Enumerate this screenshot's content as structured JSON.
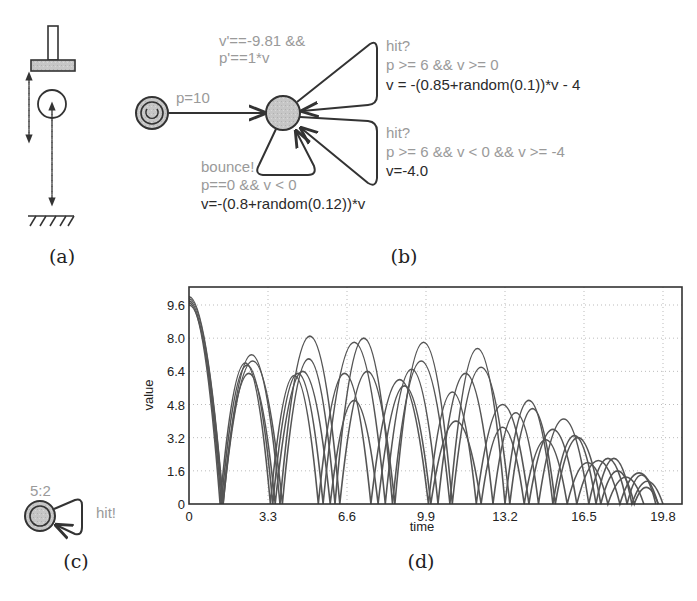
{
  "panels": {
    "a": {
      "caption": "(a)",
      "elements": [
        "paddle",
        "ball",
        "ground",
        "paddle-motion-arrow",
        "ball-motion-arrow"
      ]
    },
    "b": {
      "caption": "(b)",
      "initial_edge_label": "p=10",
      "invariant_line1": "v'==-9.81 &&",
      "invariant_line2": "p'==1*v",
      "hit1": {
        "sync": "hit?",
        "guard": "p >= 6 && v >= 0",
        "update": "v = -(0.85+random(0.1))*v - 4"
      },
      "hit2": {
        "sync": "hit?",
        "guard": "p >= 6 && v < 0 && v >= -4",
        "update": "v=-4.0"
      },
      "bounce": {
        "sync": "bounce!",
        "guard": "p==0 && v < 0",
        "update": "v=-(0.8+random(0.12))*v"
      }
    },
    "c": {
      "caption": "(c)",
      "rate_label": "5:2",
      "sync": "hit!"
    },
    "d": {
      "caption": "(d)"
    }
  },
  "colors": {
    "guard_text": "#9a9a9a",
    "update_text": "#2a2a2a",
    "node_fill": "#c8c8c8",
    "curve": "#555555"
  },
  "chart_data": {
    "type": "line",
    "title": "",
    "xlabel": "time",
    "ylabel": "value",
    "xlim": [
      0,
      20.5
    ],
    "ylim": [
      0,
      10.4
    ],
    "x_ticks": [
      "0",
      "3.3",
      "6.6",
      "9.9",
      "13.2",
      "16.5",
      "19.8"
    ],
    "y_ticks": [
      "0",
      "1.6",
      "3.2",
      "4.8",
      "6.4",
      "8.0",
      "9.6"
    ],
    "grid": true,
    "legend": "none",
    "series": [
      {
        "name": "run1",
        "bounces": [
          [
            0,
            10
          ],
          [
            1.43,
            0
          ],
          [
            2.6,
            7.2
          ],
          [
            3.8,
            0
          ],
          [
            5.0,
            8.1
          ],
          [
            6.3,
            0
          ],
          [
            7.2,
            6.4
          ],
          [
            8.6,
            0
          ],
          [
            9.7,
            7.8
          ],
          [
            11.0,
            0
          ],
          [
            12.1,
            6.6
          ],
          [
            13.4,
            0
          ],
          [
            14.2,
            4.6
          ],
          [
            15.3,
            0
          ],
          [
            16.1,
            3.2
          ],
          [
            17.2,
            0
          ],
          [
            17.8,
            1.6
          ],
          [
            18.6,
            0
          ],
          [
            19.1,
            0.8
          ],
          [
            19.6,
            0
          ]
        ]
      },
      {
        "name": "run2",
        "bounces": [
          [
            0,
            9.9
          ],
          [
            1.42,
            0
          ],
          [
            2.7,
            6.9
          ],
          [
            3.9,
            0
          ],
          [
            4.9,
            7.0
          ],
          [
            6.1,
            0
          ],
          [
            7.3,
            8.0
          ],
          [
            8.5,
            0
          ],
          [
            9.6,
            6.9
          ],
          [
            10.9,
            0
          ],
          [
            11.9,
            7.5
          ],
          [
            13.2,
            0
          ],
          [
            14.0,
            5.0
          ],
          [
            15.2,
            0
          ],
          [
            16.0,
            3.3
          ],
          [
            17.0,
            0
          ],
          [
            17.7,
            2.2
          ],
          [
            18.5,
            0
          ],
          [
            19.2,
            1.1
          ],
          [
            19.8,
            0
          ]
        ]
      },
      {
        "name": "run3",
        "bounces": [
          [
            0,
            9.8
          ],
          [
            1.35,
            0
          ],
          [
            2.4,
            6.7
          ],
          [
            3.5,
            0
          ],
          [
            4.5,
            6.3
          ],
          [
            5.6,
            0
          ],
          [
            6.9,
            7.8
          ],
          [
            8.2,
            0
          ],
          [
            9.2,
            6.5
          ],
          [
            10.4,
            0
          ],
          [
            11.5,
            6.3
          ],
          [
            12.7,
            0
          ],
          [
            13.6,
            4.4
          ],
          [
            14.6,
            0
          ],
          [
            15.6,
            4.1
          ],
          [
            16.7,
            0
          ],
          [
            17.5,
            2.2
          ],
          [
            18.3,
            0
          ],
          [
            18.9,
            1.4
          ],
          [
            19.5,
            0
          ]
        ]
      },
      {
        "name": "run4",
        "bounces": [
          [
            0,
            9.7
          ],
          [
            1.3,
            0
          ],
          [
            2.3,
            6.8
          ],
          [
            3.4,
            0
          ],
          [
            4.4,
            6.2
          ],
          [
            5.4,
            0
          ],
          [
            6.5,
            6.3
          ],
          [
            7.6,
            0
          ],
          [
            8.8,
            6.0
          ],
          [
            10.0,
            0
          ],
          [
            11.0,
            5.4
          ],
          [
            12.0,
            0
          ],
          [
            13.1,
            4.8
          ],
          [
            14.2,
            0
          ],
          [
            15.2,
            3.6
          ],
          [
            16.2,
            0
          ],
          [
            17.2,
            2.1
          ],
          [
            18.0,
            0
          ],
          [
            18.8,
            1.5
          ],
          [
            19.6,
            0
          ]
        ]
      },
      {
        "name": "run5",
        "bounces": [
          [
            0,
            9.6
          ],
          [
            1.4,
            0
          ],
          [
            2.5,
            6.3
          ],
          [
            3.6,
            0
          ],
          [
            4.7,
            6.4
          ],
          [
            5.9,
            0
          ],
          [
            6.8,
            5.0
          ],
          [
            7.9,
            0
          ],
          [
            9.0,
            5.7
          ],
          [
            10.1,
            0
          ],
          [
            11.2,
            4.0
          ],
          [
            12.2,
            0
          ],
          [
            13.0,
            3.7
          ],
          [
            14.0,
            0
          ],
          [
            14.9,
            3.1
          ],
          [
            15.8,
            0
          ],
          [
            16.7,
            2.0
          ],
          [
            17.5,
            0
          ],
          [
            18.3,
            1.3
          ],
          [
            19.0,
            0
          ]
        ]
      }
    ]
  }
}
